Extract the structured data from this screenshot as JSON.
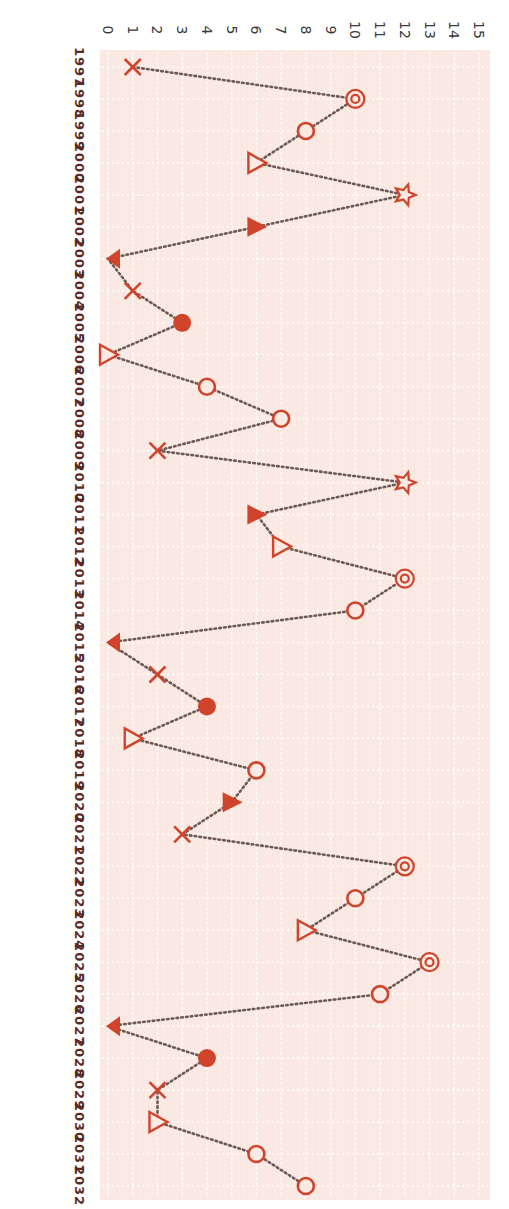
{
  "chart_data": {
    "type": "line",
    "orientation": "rotated-90-clockwise",
    "title": "",
    "xlabel": "",
    "ylabel": "",
    "ylim": [
      0,
      15
    ],
    "y_ticks": [
      0,
      1,
      2,
      3,
      4,
      5,
      6,
      7,
      8,
      9,
      10,
      11,
      12,
      13,
      14,
      15
    ],
    "grid": true,
    "legend": null,
    "line_style": "dotted",
    "colors": {
      "marker": "#d0442c",
      "line": "#6b5a55",
      "plot_background": "#fbe9e3",
      "grid": "#ffffff",
      "year_label": "#5a2a22",
      "tick_label": "#3a3a3a"
    },
    "categories": [
      "1997",
      "1998",
      "1999",
      "2000",
      "2001",
      "2002",
      "2003",
      "2004",
      "2005",
      "2006",
      "2007",
      "2008",
      "2009",
      "2010",
      "2011",
      "2012",
      "2013",
      "2014",
      "2015",
      "2016",
      "2017",
      "2018",
      "2019",
      "2020",
      "2021",
      "2022",
      "2023",
      "2024",
      "2025",
      "2026",
      "2027",
      "2028",
      "2029",
      "2030",
      "2031",
      "2032"
    ],
    "series": [
      {
        "name": "series",
        "values": [
          1,
          10,
          8,
          6,
          12,
          6,
          0,
          1,
          3,
          0,
          4,
          7,
          2,
          12,
          6,
          7,
          12,
          10,
          0,
          2,
          4,
          1,
          6,
          5,
          3,
          12,
          10,
          8,
          13,
          11,
          0,
          4,
          2,
          2,
          6,
          8
        ],
        "markers": [
          "x",
          "double-circle",
          "circle",
          "triangle-open",
          "star",
          "triangle-filled",
          "triangle-filled-left",
          "x",
          "dot",
          "triangle-open",
          "circle",
          "circle",
          "x",
          "star",
          "triangle-filled",
          "triangle-open",
          "double-circle",
          "circle",
          "triangle-filled-left",
          "x",
          "dot",
          "triangle-open",
          "circle",
          "triangle-filled",
          "x",
          "double-circle",
          "circle",
          "triangle-open",
          "double-circle",
          "circle",
          "triangle-filled-left",
          "dot",
          "x",
          "triangle-open",
          "circle",
          "circle"
        ]
      }
    ]
  }
}
